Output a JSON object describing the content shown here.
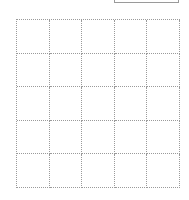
{
  "grid": {
    "rows": 5,
    "columns": 5,
    "line_color": "#9a9a9a",
    "line_style": "dotted"
  },
  "top_box": {
    "border_color": "#9a9a9a"
  }
}
